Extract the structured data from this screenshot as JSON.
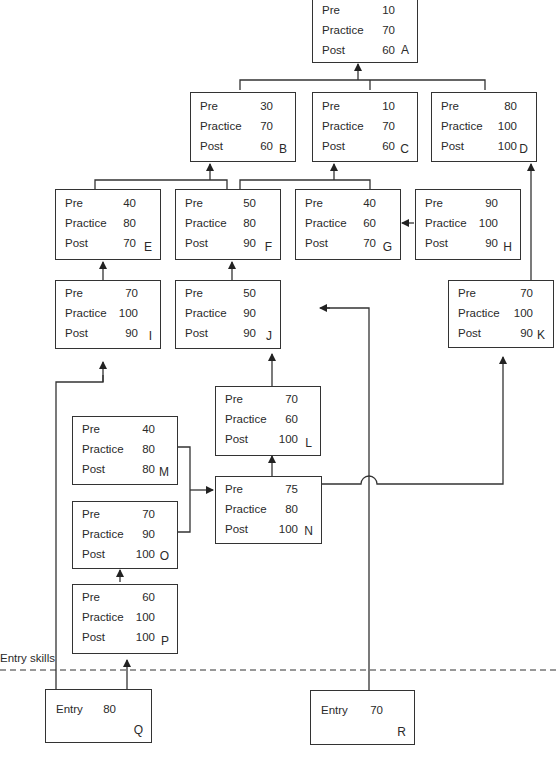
{
  "diagram": {
    "entry_line_label": "Entry skills",
    "row_labels": {
      "pre": "Pre",
      "practice": "Practice",
      "post": "Post",
      "entry": "Entry"
    },
    "nodes": {
      "A": {
        "id": "A",
        "pre": "10",
        "practice": "70",
        "post": "60"
      },
      "B": {
        "id": "B",
        "pre": "30",
        "practice": "70",
        "post": "60"
      },
      "C": {
        "id": "C",
        "pre": "10",
        "practice": "70",
        "post": "60"
      },
      "D": {
        "id": "D",
        "pre": "80",
        "practice": "100",
        "post": "100"
      },
      "E": {
        "id": "E",
        "pre": "40",
        "practice": "80",
        "post": "70"
      },
      "F": {
        "id": "F",
        "pre": "50",
        "practice": "80",
        "post": "90"
      },
      "G": {
        "id": "G",
        "pre": "40",
        "practice": "60",
        "post": "70"
      },
      "H": {
        "id": "H",
        "pre": "90",
        "practice": "100",
        "post": "90"
      },
      "I": {
        "id": "I",
        "pre": "70",
        "practice": "100",
        "post": "90"
      },
      "J": {
        "id": "J",
        "pre": "50",
        "practice": "90",
        "post": "90"
      },
      "K": {
        "id": "K",
        "pre": "70",
        "practice": "100",
        "post": "90"
      },
      "L": {
        "id": "L",
        "pre": "70",
        "practice": "60",
        "post": "100"
      },
      "M": {
        "id": "M",
        "pre": "40",
        "practice": "80",
        "post": "80"
      },
      "N": {
        "id": "N",
        "pre": "75",
        "practice": "80",
        "post": "100"
      },
      "O": {
        "id": "O",
        "pre": "70",
        "practice": "90",
        "post": "100"
      },
      "P": {
        "id": "P",
        "pre": "60",
        "practice": "100",
        "post": "100"
      },
      "Q": {
        "id": "Q",
        "entry": "80"
      },
      "R": {
        "id": "R",
        "entry": "70"
      }
    },
    "edges": [
      [
        "B",
        "A"
      ],
      [
        "C",
        "A"
      ],
      [
        "D",
        "A"
      ],
      [
        "E",
        "B"
      ],
      [
        "F",
        "B"
      ],
      [
        "F",
        "C"
      ],
      [
        "G",
        "C"
      ],
      [
        "H",
        "G"
      ],
      [
        "I",
        "E"
      ],
      [
        "J",
        "F"
      ],
      [
        "K",
        "D"
      ],
      [
        "L",
        "J"
      ],
      [
        "N",
        "L"
      ],
      [
        "M",
        "N"
      ],
      [
        "O",
        "N"
      ],
      [
        "N",
        "K"
      ],
      [
        "P",
        "O"
      ],
      [
        "Q",
        "P"
      ],
      [
        "Q",
        "I"
      ],
      [
        "R",
        "J"
      ]
    ]
  },
  "colors": {
    "line": "#333333",
    "text": "#2a2a2a",
    "background": "#ffffff"
  }
}
